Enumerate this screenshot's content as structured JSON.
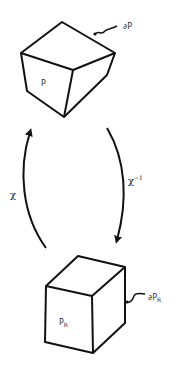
{
  "diagram": {
    "top_shape": {
      "label": "P",
      "boundary_label": "∂P"
    },
    "bottom_shape": {
      "label": "P",
      "label_sub": "R",
      "boundary_label": "∂P",
      "boundary_label_sub": "R"
    },
    "arrows": {
      "left": {
        "label": "χ",
        "direction": "up"
      },
      "right": {
        "label": "χ",
        "label_sup": "−1",
        "direction": "down"
      }
    },
    "colors": {
      "stroke": "#111111",
      "text": "#333333",
      "background": "#ffffff"
    }
  }
}
